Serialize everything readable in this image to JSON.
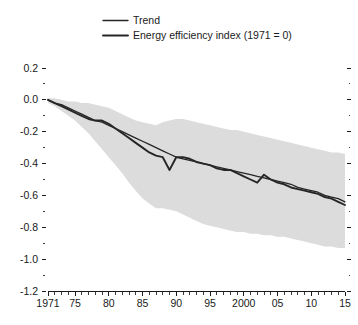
{
  "chart_data": {
    "type": "line",
    "title": "",
    "subtitle": "",
    "xlabel": "",
    "ylabel": "",
    "xlim": [
      1971,
      2015
    ],
    "ylim": [
      -1.2,
      0.2
    ],
    "y_ticks": [
      "0.2",
      "0.0",
      "-0.2",
      "-0.4",
      "-0.6",
      "-0.8",
      "-1.0",
      "-1.2"
    ],
    "y_tick_values": [
      0.2,
      0.0,
      -0.2,
      -0.4,
      -0.6,
      -0.8,
      -1.0,
      -1.2
    ],
    "y_minor_step": 0.1,
    "x_tick_labels": [
      "1971",
      "75",
      "80",
      "85",
      "90",
      "95",
      "2000",
      "05",
      "10",
      "15"
    ],
    "x_tick_values": [
      1971,
      1975,
      1980,
      1985,
      1990,
      1995,
      2000,
      2005,
      2010,
      2015
    ],
    "x_minor_step": 1,
    "grid": false,
    "legend_position": "top-center",
    "legend": [
      {
        "label": "Trend",
        "color": "#262626",
        "width": 1.3
      },
      {
        "label": "Energy efficiency index (1971 = 0)",
        "color": "#262626",
        "width": 1.9
      }
    ],
    "band": {
      "name": "confidence-band",
      "color": "#dcdcdc",
      "x": [
        1971,
        1972,
        1973,
        1974,
        1975,
        1976,
        1977,
        1978,
        1979,
        1980,
        1981,
        1982,
        1983,
        1984,
        1985,
        1986,
        1987,
        1988,
        1989,
        1990,
        1991,
        1992,
        1993,
        1994,
        1995,
        1996,
        1997,
        1998,
        1999,
        2000,
        2001,
        2002,
        2003,
        2004,
        2005,
        2006,
        2007,
        2008,
        2009,
        2010,
        2011,
        2012,
        2013,
        2014,
        2015
      ],
      "upper": [
        0.01,
        0.01,
        0.0,
        -0.01,
        -0.01,
        -0.02,
        -0.02,
        -0.03,
        -0.04,
        -0.05,
        -0.07,
        -0.09,
        -0.11,
        -0.13,
        -0.14,
        -0.15,
        -0.16,
        -0.14,
        -0.13,
        -0.12,
        -0.12,
        -0.13,
        -0.14,
        -0.15,
        -0.16,
        -0.17,
        -0.18,
        -0.19,
        -0.19,
        -0.2,
        -0.21,
        -0.22,
        -0.23,
        -0.24,
        -0.25,
        -0.26,
        -0.27,
        -0.28,
        -0.29,
        -0.3,
        -0.31,
        -0.32,
        -0.33,
        -0.33,
        -0.34
      ],
      "lower": [
        -0.02,
        -0.04,
        -0.07,
        -0.1,
        -0.13,
        -0.17,
        -0.21,
        -0.26,
        -0.31,
        -0.36,
        -0.41,
        -0.46,
        -0.52,
        -0.57,
        -0.62,
        -0.65,
        -0.68,
        -0.68,
        -0.69,
        -0.7,
        -0.72,
        -0.74,
        -0.76,
        -0.78,
        -0.79,
        -0.8,
        -0.81,
        -0.82,
        -0.83,
        -0.83,
        -0.84,
        -0.84,
        -0.85,
        -0.85,
        -0.86,
        -0.86,
        -0.87,
        -0.88,
        -0.89,
        -0.9,
        -0.91,
        -0.92,
        -0.92,
        -0.93,
        -0.93
      ]
    },
    "series": [
      {
        "name": "Trend",
        "color": "#262626",
        "width": 1.3,
        "x": [
          1971,
          1972,
          1973,
          1974,
          1975,
          1976,
          1977,
          1978,
          1979,
          1980,
          1981,
          1982,
          1983,
          1984,
          1985,
          1986,
          1987,
          1988,
          1989,
          1990,
          1991,
          1992,
          1993,
          1994,
          1995,
          1996,
          1997,
          1998,
          1999,
          2000,
          2001,
          2002,
          2003,
          2004,
          2005,
          2006,
          2007,
          2008,
          2009,
          2010,
          2011,
          2012,
          2013,
          2014,
          2015
        ],
        "values": [
          0.0,
          -0.02,
          -0.03,
          -0.05,
          -0.07,
          -0.09,
          -0.11,
          -0.13,
          -0.14,
          -0.16,
          -0.18,
          -0.2,
          -0.22,
          -0.24,
          -0.26,
          -0.28,
          -0.3,
          -0.32,
          -0.34,
          -0.36,
          -0.37,
          -0.38,
          -0.39,
          -0.4,
          -0.41,
          -0.42,
          -0.43,
          -0.44,
          -0.45,
          -0.46,
          -0.47,
          -0.48,
          -0.49,
          -0.5,
          -0.51,
          -0.52,
          -0.53,
          -0.55,
          -0.56,
          -0.57,
          -0.58,
          -0.6,
          -0.61,
          -0.62,
          -0.64
        ]
      },
      {
        "name": "Energy efficiency index (1971 = 0)",
        "color": "#262626",
        "width": 1.9,
        "x": [
          1971,
          1972,
          1973,
          1974,
          1975,
          1976,
          1977,
          1978,
          1979,
          1980,
          1981,
          1982,
          1983,
          1984,
          1985,
          1986,
          1987,
          1988,
          1989,
          1990,
          1991,
          1992,
          1993,
          1994,
          1995,
          1996,
          1997,
          1998,
          1999,
          2000,
          2001,
          2002,
          2003,
          2004,
          2005,
          2006,
          2007,
          2008,
          2009,
          2010,
          2011,
          2012,
          2013,
          2014,
          2015
        ],
        "values": [
          0.0,
          -0.02,
          -0.04,
          -0.06,
          -0.08,
          -0.1,
          -0.12,
          -0.13,
          -0.13,
          -0.15,
          -0.18,
          -0.21,
          -0.24,
          -0.27,
          -0.3,
          -0.33,
          -0.35,
          -0.36,
          -0.44,
          -0.36,
          -0.36,
          -0.37,
          -0.39,
          -0.4,
          -0.41,
          -0.43,
          -0.44,
          -0.44,
          -0.46,
          -0.48,
          -0.5,
          -0.52,
          -0.47,
          -0.5,
          -0.52,
          -0.53,
          -0.55,
          -0.56,
          -0.57,
          -0.58,
          -0.59,
          -0.61,
          -0.62,
          -0.64,
          -0.66
        ]
      }
    ]
  }
}
